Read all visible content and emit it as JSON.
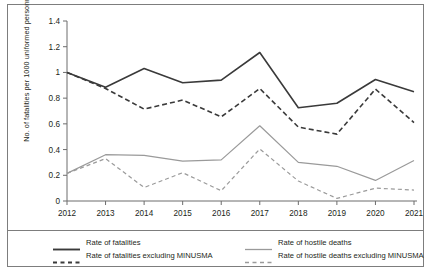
{
  "chart_data": {
    "type": "line",
    "title": "",
    "xlabel": "",
    "ylabel": "No. of fatalities per 1000 uniformed personnel",
    "categories": [
      "2012",
      "2013",
      "2014",
      "2015",
      "2016",
      "2017",
      "2018",
      "2019",
      "2020",
      "2021"
    ],
    "x": [
      2012,
      2013,
      2014,
      2015,
      2016,
      2017,
      2018,
      2019,
      2020,
      2021
    ],
    "ylim": [
      0,
      1.4
    ],
    "yticks": [
      "0",
      "0.2",
      "0.4",
      "0.6",
      "0.8",
      "1",
      "1.2",
      "1.4"
    ],
    "ytick_values": [
      0,
      0.2,
      0.4,
      0.6,
      0.8,
      1.0,
      1.2,
      1.4
    ],
    "grid": false,
    "legend_position": "bottom",
    "series": [
      {
        "name": "Rate of fatalities",
        "style": "solid",
        "color": "#3a3a3a",
        "values": [
          1.0,
          0.885,
          1.03,
          0.92,
          0.94,
          1.155,
          0.725,
          0.76,
          0.945,
          0.85
        ]
      },
      {
        "name": "Rate of fatalities excluding MINUSMA",
        "style": "dashed",
        "color": "#3a3a3a",
        "values": [
          1.0,
          0.875,
          0.715,
          0.785,
          0.655,
          0.875,
          0.575,
          0.52,
          0.87,
          0.61
        ]
      },
      {
        "name": "Rate of hostile deaths",
        "style": "solid",
        "color": "#9a9a9a",
        "values": [
          0.215,
          0.36,
          0.355,
          0.31,
          0.32,
          0.585,
          0.3,
          0.27,
          0.16,
          0.315
        ]
      },
      {
        "name": "Rate of hostile deaths excluding MINUSMA",
        "style": "dashed",
        "color": "#9a9a9a",
        "values": [
          0.215,
          0.33,
          0.105,
          0.22,
          0.08,
          0.405,
          0.155,
          0.02,
          0.1,
          0.085
        ]
      }
    ]
  },
  "legend": {
    "entries": [
      {
        "label": "Rate of fatalities",
        "style": "solid",
        "color": "#3a3a3a"
      },
      {
        "label": "Rate of hostile deaths",
        "style": "solid",
        "color": "#9a9a9a"
      },
      {
        "label": "Rate of fatalities excluding MINUSMA",
        "style": "dashed",
        "color": "#3a3a3a"
      },
      {
        "label": "Rate of hostile deaths excluding MINUSMA",
        "style": "dashed",
        "color": "#9a9a9a"
      }
    ]
  }
}
